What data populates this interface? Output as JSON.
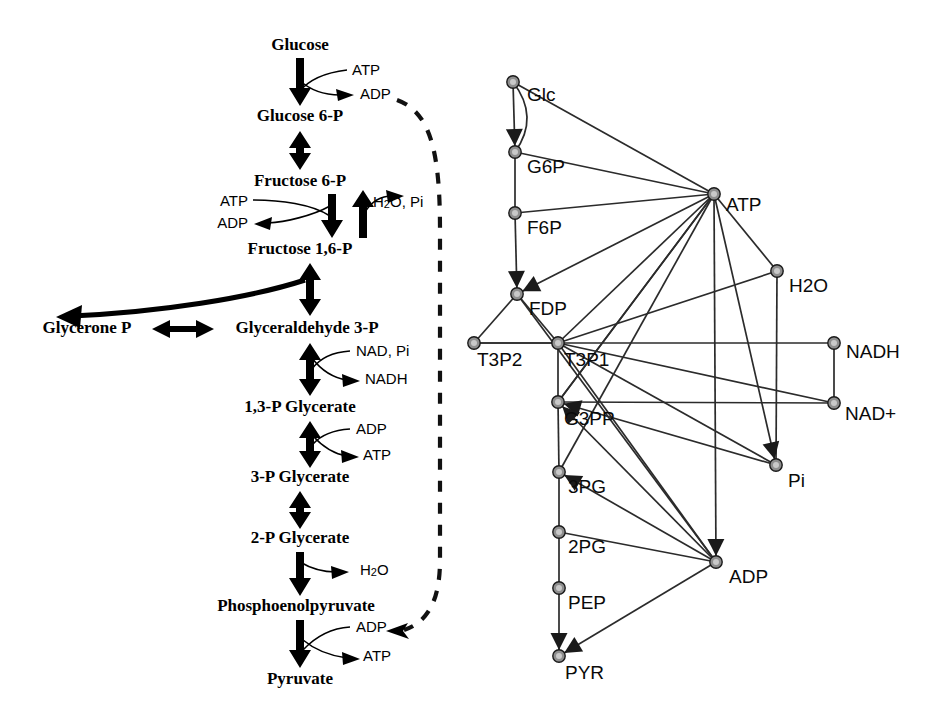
{
  "figure": {
    "colors": {
      "ink": "#000000",
      "edge": "#2b2b2b",
      "node_fill": "#8e8e8e",
      "node_highlight": "#c9c9c9",
      "background": "#ffffff"
    }
  },
  "pathway": {
    "name": "glycolysis-linear-pathway",
    "metabolites": [
      {
        "id": "glucose",
        "label": "Glucose",
        "x": 300,
        "y": 46
      },
      {
        "id": "g6p",
        "label": "Glucose 6-P",
        "x": 300,
        "y": 117
      },
      {
        "id": "f6p",
        "label": "Fructose 6-P",
        "x": 300,
        "y": 182
      },
      {
        "id": "fdp",
        "label": "Fructose 1,6-P",
        "x": 300,
        "y": 250
      },
      {
        "id": "gap",
        "label": "Glyceraldehyde 3-P",
        "x": 300,
        "y": 329
      },
      {
        "id": "dhap",
        "label": "Glycerone P",
        "x": 105,
        "y": 329
      },
      {
        "id": "bpg",
        "label": "1,3-P Glycerate",
        "x": 300,
        "y": 408
      },
      {
        "id": "pg3",
        "label": "3-P Glycerate",
        "x": 300,
        "y": 478
      },
      {
        "id": "pg2",
        "label": "2-P Glycerate",
        "x": 300,
        "y": 539
      },
      {
        "id": "pep",
        "label": "Phosphoenolpyruvate",
        "x": 300,
        "y": 607
      },
      {
        "id": "pyruvate",
        "label": "Pyruvate",
        "x": 300,
        "y": 680
      }
    ],
    "cofactors": [
      {
        "id": "atp-hexokinase",
        "label": "ATP",
        "x": 352,
        "y": 71,
        "align": "start",
        "role": "substrate"
      },
      {
        "id": "adp-hexokinase",
        "label": "ADP",
        "x": 360,
        "y": 95,
        "align": "start",
        "role": "product"
      },
      {
        "id": "atp-pfk",
        "label": "ATP",
        "x": 244,
        "y": 202,
        "align": "end",
        "role": "substrate"
      },
      {
        "id": "adp-pfk",
        "label": "ADP",
        "x": 244,
        "y": 224,
        "align": "end",
        "role": "product"
      },
      {
        "id": "h2o-pi-fbpase",
        "label": "H2O, Pi",
        "x": 373,
        "y": 203,
        "align": "start",
        "role": "product"
      },
      {
        "id": "nad-pi-gapdh",
        "label": "NAD, Pi",
        "x": 356,
        "y": 352,
        "align": "start",
        "role": "substrate"
      },
      {
        "id": "nadh-gapdh",
        "label": "NADH",
        "x": 365,
        "y": 380,
        "align": "start",
        "role": "product"
      },
      {
        "id": "adp-pgk",
        "label": "ADP",
        "x": 356,
        "y": 430,
        "align": "start",
        "role": "substrate"
      },
      {
        "id": "atp-pgk",
        "label": "ATP",
        "x": 363,
        "y": 456,
        "align": "start",
        "role": "product"
      },
      {
        "id": "h2o-enolase",
        "label": "H2O",
        "x": 360,
        "y": 571,
        "align": "start",
        "role": "product"
      },
      {
        "id": "adp-pyk",
        "label": "ADP",
        "x": 356,
        "y": 628,
        "align": "start",
        "role": "substrate"
      },
      {
        "id": "atp-pyk",
        "label": "ATP",
        "x": 363,
        "y": 657,
        "align": "start",
        "role": "product"
      }
    ],
    "feedback_loop": {
      "id": "adp-recycle-loop",
      "style": "dashed",
      "from": "adp-hexokinase",
      "to": "adp-pyk",
      "description": "dashed ADP recycling arc from upper ADP down to ADP at the pyruvate kinase step"
    }
  },
  "network": {
    "name": "metabolite-interaction-network",
    "nodes": [
      {
        "id": "Glc",
        "label": "Glc",
        "x": 53,
        "y": 82,
        "label_dx": 14,
        "label_dy": 14
      },
      {
        "id": "G6P",
        "label": "G6P",
        "x": 55,
        "y": 152,
        "label_dx": 12,
        "label_dy": 16
      },
      {
        "id": "F6P",
        "label": "F6P",
        "x": 55,
        "y": 213,
        "label_dx": 12,
        "label_dy": 16
      },
      {
        "id": "FDP",
        "label": "FDP",
        "x": 57,
        "y": 294,
        "label_dx": 12,
        "label_dy": 16
      },
      {
        "id": "T3P2",
        "label": "T3P2",
        "x": 14,
        "y": 343,
        "label_dx": 3,
        "label_dy": 18
      },
      {
        "id": "T3P1",
        "label": "T3P1",
        "x": 98,
        "y": 343,
        "label_dx": 6,
        "label_dy": 18
      },
      {
        "id": "G3PP",
        "label": "G3PP",
        "x": 98,
        "y": 402,
        "label_dx": 6,
        "label_dy": 18
      },
      {
        "id": "3PG",
        "label": "3PG",
        "x": 99,
        "y": 472,
        "label_dx": 9,
        "label_dy": 16
      },
      {
        "id": "2PG",
        "label": "2PG",
        "x": 99,
        "y": 532,
        "label_dx": 9,
        "label_dy": 16
      },
      {
        "id": "PEP",
        "label": "PEP",
        "x": 99,
        "y": 588,
        "label_dx": 9,
        "label_dy": 16
      },
      {
        "id": "PYR",
        "label": "PYR",
        "x": 99,
        "y": 656,
        "label_dx": 6,
        "label_dy": 18
      },
      {
        "id": "ATP",
        "label": "ATP",
        "x": 254,
        "y": 194,
        "label_dx": 12,
        "label_dy": 12
      },
      {
        "id": "H2O",
        "label": "H2O",
        "x": 317,
        "y": 271,
        "label_dx": 12,
        "label_dy": 16
      },
      {
        "id": "NADH",
        "label": "NADH",
        "x": 374,
        "y": 343,
        "label_dx": 12,
        "label_dy": 10
      },
      {
        "id": "NAD+",
        "label": "NAD+",
        "x": 374,
        "y": 403,
        "label_dx": 11,
        "label_dy": 12
      },
      {
        "id": "Pi",
        "label": "Pi",
        "x": 316,
        "y": 465,
        "label_dx": 12,
        "label_dy": 17
      },
      {
        "id": "ADP",
        "label": "ADP",
        "x": 256,
        "y": 562,
        "label_dx": 13,
        "label_dy": 16
      }
    ],
    "edges": [
      {
        "from": "Glc",
        "to": "G6P",
        "arrow": true
      },
      {
        "from": "Glc",
        "to": "G6P",
        "arrow": false,
        "curve": "right"
      },
      {
        "from": "G6P",
        "to": "F6P",
        "arrow": false
      },
      {
        "from": "F6P",
        "to": "FDP",
        "arrow": true
      },
      {
        "from": "FDP",
        "to": "T3P2",
        "arrow": false
      },
      {
        "from": "FDP",
        "to": "T3P1",
        "arrow": false
      },
      {
        "from": "T3P2",
        "to": "T3P1",
        "arrow": false
      },
      {
        "from": "T3P1",
        "to": "G3PP",
        "arrow": false
      },
      {
        "from": "G3PP",
        "to": "3PG",
        "arrow": false
      },
      {
        "from": "3PG",
        "to": "2PG",
        "arrow": false
      },
      {
        "from": "2PG",
        "to": "PEP",
        "arrow": false
      },
      {
        "from": "PEP",
        "to": "PYR",
        "arrow": true
      },
      {
        "from": "G6P",
        "to": "ATP",
        "arrow": false
      },
      {
        "from": "F6P",
        "to": "ATP",
        "arrow": false
      },
      {
        "from": "Glc",
        "to": "ATP",
        "arrow": false
      },
      {
        "from": "ATP",
        "to": "FDP",
        "arrow": true
      },
      {
        "from": "ATP",
        "to": "H2O",
        "arrow": false
      },
      {
        "from": "ATP",
        "to": "T3P1",
        "arrow": false
      },
      {
        "from": "ATP",
        "to": "G3PP",
        "arrow": false
      },
      {
        "from": "ATP",
        "to": "3PG",
        "arrow": false
      },
      {
        "from": "ATP",
        "to": "ADP",
        "arrow": true
      },
      {
        "from": "ATP",
        "to": "Pi",
        "arrow": true
      },
      {
        "from": "H2O",
        "to": "Pi",
        "arrow": false
      },
      {
        "from": "H2O",
        "to": "T3P1",
        "arrow": false
      },
      {
        "from": "NADH",
        "to": "NAD+",
        "arrow": false
      },
      {
        "from": "NADH",
        "to": "T3P2",
        "arrow": false
      },
      {
        "from": "NAD+",
        "to": "G3PP",
        "arrow": false
      },
      {
        "from": "NAD+",
        "to": "T3P1",
        "arrow": false
      },
      {
        "from": "Pi",
        "to": "G3PP",
        "arrow": true
      },
      {
        "from": "Pi",
        "to": "T3P1",
        "arrow": false
      },
      {
        "from": "ADP",
        "to": "G3PP",
        "arrow": true
      },
      {
        "from": "ADP",
        "to": "3PG",
        "arrow": true
      },
      {
        "from": "ADP",
        "to": "2PG",
        "arrow": false
      },
      {
        "from": "ADP",
        "to": "PYR",
        "arrow": true
      },
      {
        "from": "ADP",
        "to": "T3P1",
        "arrow": false
      },
      {
        "from": "FDP",
        "to": "ADP",
        "arrow": false
      },
      {
        "from": "G3PP",
        "to": "ATP",
        "arrow": false
      }
    ]
  }
}
